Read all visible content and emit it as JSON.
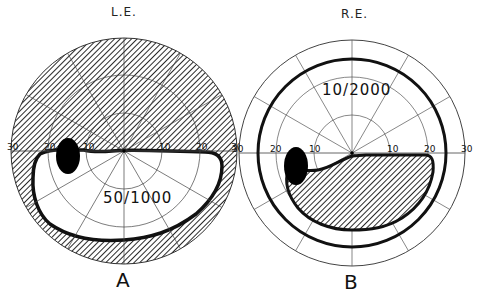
{
  "figure": {
    "panels": [
      {
        "id": "A",
        "eye_label": "L.E.",
        "panel_label": "A",
        "acuity": "50/1000",
        "scale_ticks_left": [
          "30",
          "20",
          "10"
        ],
        "scale_ticks_right": [
          "10",
          "20",
          "30"
        ],
        "description": "Left eye: superior hemifield lost (hatched), inferior field preserved within isopter; blind spot marked temporally"
      },
      {
        "id": "B",
        "eye_label": "R.E.",
        "panel_label": "B",
        "acuity": "10/2000",
        "scale_ticks_left": [
          "30",
          "20",
          "10"
        ],
        "scale_ticks_right": [
          "10",
          "20",
          "30"
        ],
        "description": "Right eye: full-field isopter with inferior hatched scotoma; blind spot marked temporally"
      }
    ],
    "colors": {
      "ink": "#111111",
      "grid": "#555555",
      "background": "#ffffff"
    }
  }
}
